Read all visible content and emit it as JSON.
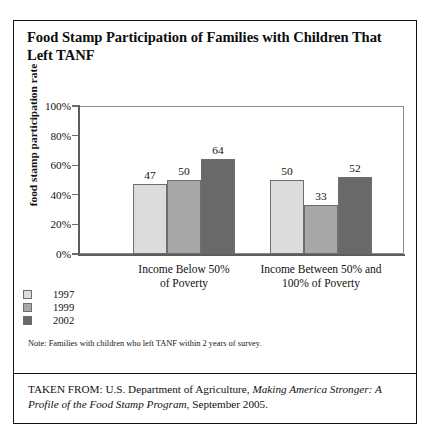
{
  "figure": {
    "title": "Food Stamp Participation of Families with Children That Left TANF",
    "note": "Note: Families with children who left TANF within 2 years of survey.",
    "source_prefix": "TAKEN FROM: U.S. Department of Agriculture, ",
    "source_italic": "Making America Stronger: A Profile of the Food Stamp Program",
    "source_suffix": ", September 2005."
  },
  "chart_data": {
    "type": "bar",
    "title": "Food Stamp Participation of Families with Children That Left TANF",
    "xlabel": "",
    "ylabel": "food stamp participation rate",
    "categories": [
      "Income Below 50% of Poverty",
      "Income Between 50% and 100% of Poverty"
    ],
    "category_lines": [
      [
        "Income Below 50%",
        "of Poverty"
      ],
      [
        "Income Between 50% and",
        "100% of Poverty"
      ]
    ],
    "series": [
      {
        "name": "1997",
        "values": [
          47,
          50
        ],
        "color": "#dcdcdc"
      },
      {
        "name": "1999",
        "values": [
          50,
          33
        ],
        "color": "#a8a8a8"
      },
      {
        "name": "2002",
        "values": [
          64,
          52
        ],
        "color": "#696969"
      }
    ],
    "ylim": [
      0,
      100
    ],
    "yticks": [
      0,
      20,
      40,
      60,
      80,
      100
    ],
    "ytick_labels": [
      "0%",
      "20%",
      "40%",
      "60%",
      "80%",
      "100%"
    ],
    "value_label_suffix": "",
    "grid": false,
    "legend_position": "below-left"
  }
}
